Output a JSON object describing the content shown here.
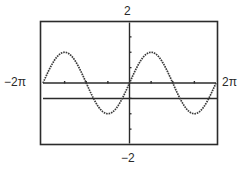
{
  "window": {
    "xmin_label": "−2π",
    "xmax_label": "2π",
    "ymin_label": "−2",
    "ymax_label": "2"
  },
  "colors": {
    "frame": "#2b2b2b",
    "axes": "#2b2b2b",
    "curve": "#3a3a3a",
    "background": "#ffffff"
  },
  "chart_data": {
    "type": "line",
    "title": "",
    "xlabel": "",
    "ylabel": "",
    "xlim": [
      -6.2832,
      6.2832
    ],
    "ylim": [
      -2,
      2
    ],
    "xscl": 1.5708,
    "yscl": 0.5,
    "grid": false,
    "axis_labels": {
      "xmin": "−2π",
      "xmax": "2π",
      "ymin": "−2",
      "ymax": "2"
    },
    "series": [
      {
        "name": "y = sin x",
        "expression": "sin(x)",
        "style": "dotted-thick",
        "x": [
          -6.2832,
          -5.4978,
          -4.7124,
          -3.927,
          -3.1416,
          -2.3562,
          -1.5708,
          -0.7854,
          0,
          0.7854,
          1.5708,
          2.3562,
          3.1416,
          3.927,
          4.7124,
          5.4978,
          6.2832
        ],
        "values": [
          0,
          0.7071,
          1,
          0.7071,
          0,
          -0.7071,
          -1,
          -0.7071,
          0,
          0.7071,
          1,
          0.7071,
          0,
          -0.7071,
          -1,
          -0.7071,
          0
        ]
      },
      {
        "name": "y = -0.5",
        "expression": "-0.5",
        "style": "solid",
        "x": [
          -6.2832,
          6.2832
        ],
        "values": [
          -0.5,
          -0.5
        ]
      }
    ]
  }
}
